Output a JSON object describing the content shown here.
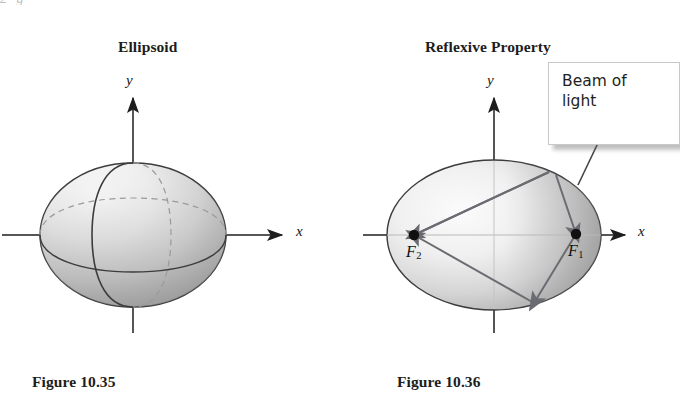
{
  "page": {
    "background": "#ffffff",
    "width": 675,
    "height": 415,
    "ink_color": "#1d1d1d",
    "clipped_top_text": "2    g"
  },
  "figures": [
    {
      "id": "ellipsoid",
      "title": "Ellipsoid",
      "caption": "Figure 10.35",
      "axes": {
        "x_label": "x",
        "y_label": "y"
      },
      "shape": {
        "kind": "ellipsoid-3d",
        "center": [
          133,
          235
        ],
        "semi_axis_x": 93,
        "semi_axis_y": 72,
        "fill_light": "#f2f2f2",
        "fill_dark": "#9a9a9a",
        "outline": "#3a3a3a"
      }
    },
    {
      "id": "reflexive-property",
      "title": "Reflexive Property",
      "caption": "Figure 10.36",
      "axes": {
        "x_label": "x",
        "y_label": "y"
      },
      "shape": {
        "kind": "ellipse-2d",
        "center": [
          494,
          235
        ],
        "semi_axis_x": 107,
        "semi_axis_y": 75,
        "fill_light": "#f4f4f4",
        "fill_dark": "#9d9d9d",
        "outline": "#3a3a3a"
      },
      "foci": [
        {
          "label": "F",
          "subscript": "1",
          "x": 576,
          "y": 234
        },
        {
          "label": "F",
          "subscript": "2",
          "x": 414,
          "y": 235
        }
      ],
      "callout": {
        "text": "Beam of\nlight",
        "x": 548,
        "y": 62,
        "width": 132,
        "height": 83,
        "background": "#ffffff",
        "border": "#c9c9c9",
        "shadow": "rgba(90,90,90,0.38)"
      },
      "beam_segments": [
        {
          "name": "incoming-beam",
          "from": [
            598,
            143
          ],
          "to": [
            556,
            183
          ]
        },
        {
          "name": "beam-to-focus-1",
          "from": [
            556,
            183
          ],
          "to": [
            576,
            234
          ]
        },
        {
          "name": "reflect-f1-to-wall",
          "from": [
            576,
            234
          ],
          "to": [
            534,
            303
          ]
        },
        {
          "name": "wall-to-focus-2",
          "from": [
            534,
            303
          ],
          "to": [
            414,
            235
          ]
        },
        {
          "name": "focus-2-to-top-wall",
          "from": [
            414,
            235
          ],
          "to": [
            549,
            174
          ]
        },
        {
          "name": "top-wall-to-focus-2",
          "from": [
            549,
            174
          ],
          "to": [
            414,
            235
          ]
        }
      ]
    }
  ]
}
